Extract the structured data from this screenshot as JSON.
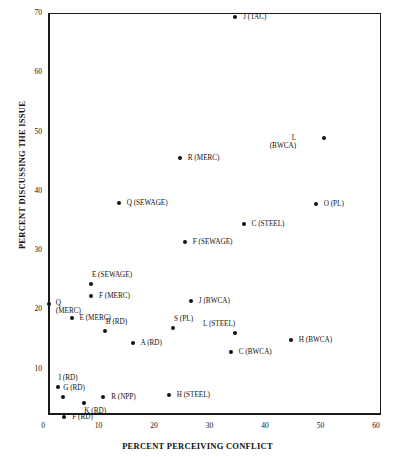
{
  "chart_data": {
    "type": "scatter",
    "title": "",
    "xlabel": "PERCENT PERCEIVING CONFLICT",
    "ylabel": "PERCENT DISCUSSING THE ISSUE",
    "xlim": [
      0,
      60
    ],
    "ylim": [
      0,
      70
    ],
    "xticks": [
      "0",
      "10",
      "20",
      "30",
      "40",
      "50",
      "60"
    ],
    "yticks": [
      "10",
      "20",
      "30",
      "40",
      "50",
      "60",
      "70"
    ],
    "grid": false,
    "legend": "none",
    "points": [
      {
        "label": "J (TAC)",
        "x": 35.0,
        "y": 69.3,
        "lx": 8,
        "ly": -4
      },
      {
        "label": "L\n(BWCA)",
        "x": 51.0,
        "y": 48.9,
        "lx": -30,
        "ly": -4
      },
      {
        "label": "R (MERC)",
        "x": 25.0,
        "y": 45.5,
        "lx": 8,
        "ly": -4
      },
      {
        "label": "O (PL)",
        "x": 49.5,
        "y": 37.8,
        "lx": 8,
        "ly": -4
      },
      {
        "label": "Q (SEWAGE)",
        "x": 14.0,
        "y": 38.0,
        "lx": 8,
        "ly": -4
      },
      {
        "label": "C (STEEL)",
        "x": 36.5,
        "y": 34.4,
        "lx": 8,
        "ly": -4
      },
      {
        "label": "F (SEWAGE)",
        "x": 25.9,
        "y": 31.3,
        "lx": 8,
        "ly": -4
      },
      {
        "label": "E (SEWAGE)",
        "x": 9.0,
        "y": 24.3,
        "lx": 1,
        "ly": -13
      },
      {
        "label": "F (MERC)",
        "x": 9.0,
        "y": 22.3,
        "lx": 8,
        "ly": -4
      },
      {
        "label": "Q\n(MERC)",
        "x": 1.4,
        "y": 21.0,
        "lx": 7,
        "ly": -5
      },
      {
        "label": "E (MERC)",
        "x": 5.5,
        "y": 18.6,
        "lx": 8,
        "ly": -4
      },
      {
        "label": "B (RD)",
        "x": 11.5,
        "y": 16.3,
        "lx": 1,
        "ly": -13
      },
      {
        "label": "S (PL)",
        "x": 23.8,
        "y": 16.8,
        "lx": 1,
        "ly": -13
      },
      {
        "label": "L (STEEL)",
        "x": 35.0,
        "y": 16.0,
        "lx": -2,
        "ly": -13
      },
      {
        "label": "J (BWCA)",
        "x": 27.0,
        "y": 21.5,
        "lx": 8,
        "ly": -4
      },
      {
        "label": "A (RD)",
        "x": 16.5,
        "y": 14.3,
        "lx": 8,
        "ly": -4
      },
      {
        "label": "H (BWCA)",
        "x": 45.0,
        "y": 14.8,
        "lx": 8,
        "ly": -4
      },
      {
        "label": "C (BWCA)",
        "x": 34.2,
        "y": 12.8,
        "lx": 8,
        "ly": -4
      },
      {
        "label": "I (RD)",
        "x": 3.0,
        "y": 6.9,
        "lx": 1,
        "ly": -13
      },
      {
        "label": "G (RD)",
        "x": 4.0,
        "y": 5.3,
        "lx": 0,
        "ly": -13
      },
      {
        "label": "R (NPP)",
        "x": 11.2,
        "y": 5.3,
        "lx": 8,
        "ly": -4
      },
      {
        "label": "H (STEEL)",
        "x": 23.0,
        "y": 5.6,
        "lx": 8,
        "ly": -4
      },
      {
        "label": "K (RD)",
        "x": 7.8,
        "y": 4.2,
        "lx": 0,
        "ly": 4
      },
      {
        "label": "F (RD)",
        "x": 4.2,
        "y": 1.9,
        "lx": 8,
        "ly": -4
      }
    ]
  }
}
